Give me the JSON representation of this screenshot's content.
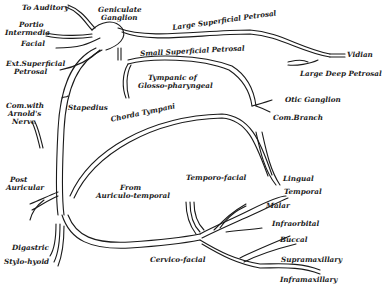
{
  "diagram": {
    "labels": {
      "to_auditory": "To Auditory",
      "geniculate_1": "Geniculate",
      "geniculate_2": "Ganglion",
      "portio_1": "Portio",
      "portio_2": "Intermedia",
      "facial": "Facial",
      "ext_sup_1": "Ext.Superficial",
      "ext_sup_2": "Petrosal",
      "large_sup_petrosal": "Large Superficial Petrosal",
      "small_sup_petrosal": "Small Superficial Petrosal",
      "vidian": "Vidian",
      "large_deep_petrosal": "Large Deep Petrosal",
      "tympanic_1": "Tympanic of",
      "tympanic_2": "Glosso-pharyngeal",
      "com_arnold_1": "Com.with",
      "com_arnold_2": "Arnold's",
      "com_arnold_3": "Nerve",
      "stapedius": "Stapedius",
      "chorda_tympani": "Chorda Tympani",
      "otic_ganglion": "Otic Ganglion",
      "com_branch": "Com.Branch",
      "lingual": "Lingual",
      "post_auricular_1": "Post",
      "post_auricular_2": "Auricular",
      "from_auriculo_1": "From",
      "from_auriculo_2": "Auriculo-temporal",
      "temporo_facial": "Temporo-facial",
      "temporal": "Temporal",
      "malar": "Malar",
      "infraorbital": "Infraorbital",
      "buccal": "Buccal",
      "digastric": "Digastric",
      "stylo_hyoid": "Stylo-hyoid",
      "cervico_facial": "Cervico-facial",
      "supramaxillary": "Supramaxillary",
      "inframaxillary": "Inframaxillary"
    },
    "colors": {
      "ink": "#1a1a1a",
      "background": "#ffffff"
    }
  }
}
